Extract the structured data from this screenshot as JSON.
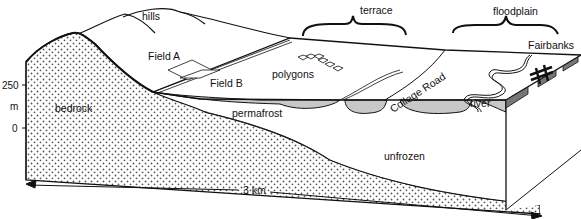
{
  "diagram": {
    "type": "geologic block diagram",
    "labels": {
      "hills": "hills",
      "terrace": "terrace",
      "floodplain": "floodplain",
      "fairbanks": "Fairbanks",
      "field_a": "Field A",
      "field_b": "Field B",
      "polygons": "polygons",
      "college_road": "College Road",
      "river": "river",
      "bedrock": "bedrock",
      "permafrost": "permafrost",
      "unfrozen": "unfrozen"
    },
    "vertical_scale": {
      "unit": "m",
      "ticks": [
        "250",
        "0"
      ]
    },
    "horizontal_scale": {
      "label": "3 km"
    },
    "colors": {
      "line": "#111111",
      "permafrost_fill": "#c8c8c8",
      "bedrock_dots": "#555555",
      "background": "#ffffff"
    }
  }
}
